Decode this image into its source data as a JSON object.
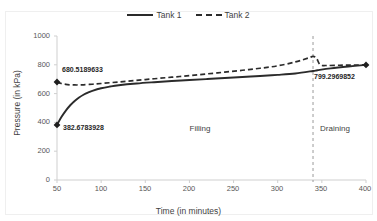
{
  "chart_data": {
    "type": "line",
    "title": "",
    "xlabel": "Time (in minutes)",
    "ylabel": "Pressure (in kPa)",
    "xlim": [
      50,
      400
    ],
    "ylim": [
      0,
      1000
    ],
    "xticks": [
      50,
      100,
      150,
      200,
      250,
      300,
      350,
      400
    ],
    "yticks": [
      0,
      200,
      400,
      600,
      800,
      1000
    ],
    "grid": false,
    "legend_position": "top-center",
    "series": [
      {
        "name": "Tank 1",
        "style": "solid",
        "color": "#2b2b2b",
        "x": [
          50,
          55,
          60,
          65,
          70,
          75,
          80,
          85,
          90,
          100,
          110,
          120,
          140,
          160,
          180,
          200,
          220,
          240,
          260,
          280,
          300,
          320,
          340,
          345,
          360,
          380,
          400
        ],
        "values": [
          382.6783928,
          437,
          482,
          519,
          549,
          573,
          592,
          607,
          619,
          637,
          649,
          658,
          670,
          679,
          687,
          694,
          701,
          708,
          715,
          722,
          730,
          740,
          757,
          762,
          775,
          788,
          799.2969852
        ]
      },
      {
        "name": "Tank 2",
        "style": "dashed",
        "color": "#2b2b2b",
        "x": [
          50,
          55,
          60,
          65,
          70,
          75,
          80,
          90,
          100,
          120,
          140,
          160,
          180,
          200,
          220,
          240,
          260,
          280,
          300,
          320,
          335,
          340,
          344,
          348,
          355,
          370,
          385,
          400
        ],
        "values": [
          680.5189633,
          670,
          664,
          661,
          660,
          660,
          661,
          665,
          670,
          681,
          692,
          703,
          714,
          725,
          737,
          749,
          762,
          776,
          793,
          820,
          848,
          858,
          845,
          800,
          795,
          797,
          798,
          799.2969852
        ]
      }
    ],
    "markers": [
      {
        "label": "680.5189633",
        "x": 50,
        "y": 680.5189633,
        "series": "Tank 2"
      },
      {
        "label": "382.6783928",
        "x": 50,
        "y": 382.6783928,
        "series": "Tank 1"
      },
      {
        "label": "799.2969852",
        "x": 400,
        "y": 799.2969852,
        "series": "Tank 1"
      }
    ],
    "annotations": [
      {
        "text": "Filling",
        "x": 200,
        "y": 300
      },
      {
        "text": "Draining",
        "x": 372,
        "y": 300
      }
    ],
    "divider": {
      "x": 340,
      "style": "dashed",
      "color": "#9a9a9a"
    }
  },
  "legend": {
    "entries": [
      {
        "label": "Tank 1"
      },
      {
        "label": "Tank 2"
      }
    ]
  },
  "axes": {
    "x_title": "Time (in minutes)",
    "y_title": "Pressure (in kPa)",
    "x_ticks": [
      "50",
      "100",
      "150",
      "200",
      "250",
      "300",
      "350",
      "400"
    ],
    "y_ticks": [
      "1000",
      "800",
      "600",
      "400",
      "200",
      "0"
    ]
  },
  "labels": {
    "point_top_left": "680.5189633",
    "point_bottom_left": "382.6783928",
    "point_right": "799.2969852",
    "phase_filling": "Filling",
    "phase_draining": "Draining"
  }
}
